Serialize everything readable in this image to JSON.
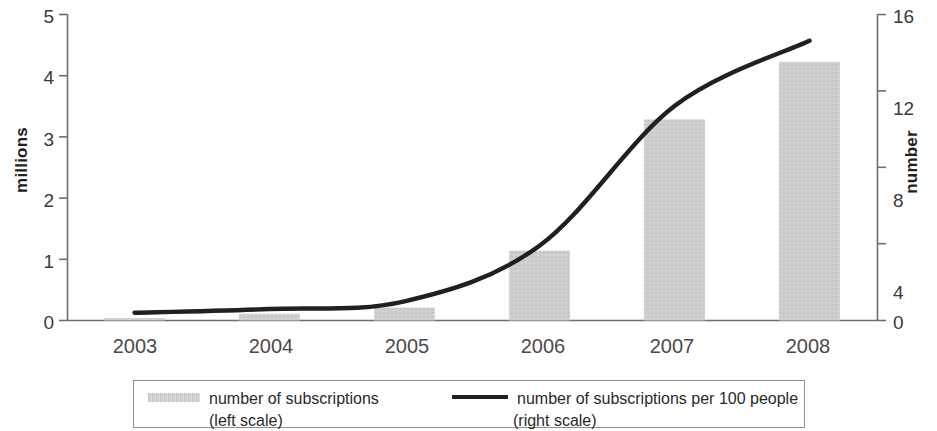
{
  "chart_data": {
    "type": "bar",
    "title": "",
    "subtitle": "",
    "categories": [
      "2003",
      "2004",
      "2005",
      "2006",
      "2007",
      "2008"
    ],
    "xlabel": "",
    "grid": false,
    "legend_position": "bottom",
    "axes": {
      "left": {
        "label": "millions",
        "ticks": [
          "0",
          "1",
          "2",
          "3",
          "4",
          "5"
        ],
        "tick_values": [
          0,
          1,
          2,
          3,
          4,
          5
        ],
        "ylim": [
          0,
          5
        ]
      },
      "right": {
        "label": "number",
        "ticks": [
          "0",
          "4",
          "8",
          "12",
          "16"
        ],
        "tick_values": [
          0,
          4,
          8,
          12,
          16
        ],
        "ylim": [
          0,
          16
        ]
      }
    },
    "series": [
      {
        "name": "number of subscriptions",
        "scale": "left",
        "type": "bar",
        "color": "#c9c9c9",
        "values": [
          0.04,
          0.11,
          0.21,
          1.14,
          3.28,
          4.22
        ]
      },
      {
        "name": "number of subscriptions per 100 people",
        "scale": "right",
        "type": "line",
        "color": "#231f20",
        "values": [
          0.4,
          0.6,
          1.0,
          3.9,
          11.2,
          14.6
        ]
      }
    ]
  },
  "legend": {
    "bar": {
      "label": "number of subscriptions",
      "scale_note": "(left scale)",
      "swatch": "bar-swatch-icon"
    },
    "line": {
      "label": "number of subscriptions per 100 people",
      "scale_note": "(right scale)",
      "swatch": "line-swatch-icon"
    }
  },
  "colors": {
    "bar_fill": "#c9c9c9",
    "line_stroke": "#231f20",
    "axis": "#6e6e6e",
    "text": "#231f20"
  }
}
